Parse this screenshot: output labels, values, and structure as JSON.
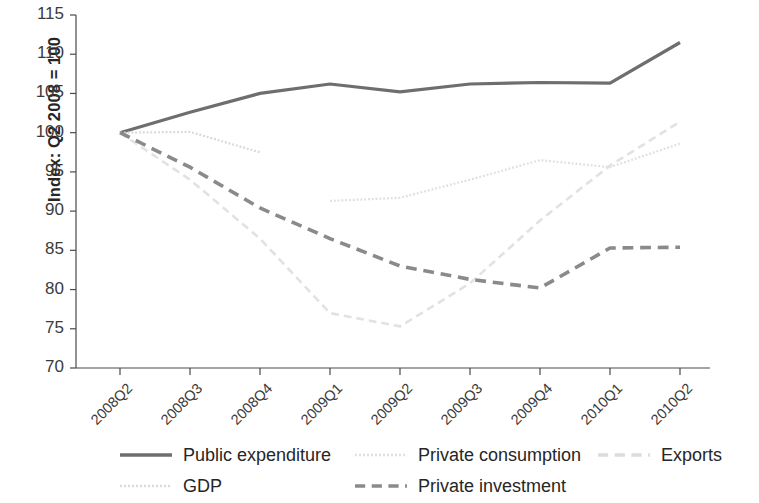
{
  "chart_data": {
    "type": "line",
    "title": "",
    "subtitle": "",
    "xlabel": "",
    "ylabel": "Index: Q2 2008 = 100",
    "categories": [
      "2008Q2",
      "2008Q3",
      "2008Q4",
      "2009Q1",
      "2009Q2",
      "2009Q3",
      "2009Q4",
      "2010Q1",
      "2010Q2"
    ],
    "ylim": [
      70,
      115
    ],
    "yticks": [
      70,
      75,
      80,
      85,
      90,
      95,
      100,
      105,
      110,
      115
    ],
    "ytick_labels": [
      "70",
      "75",
      "80",
      "85",
      "90",
      "95",
      "100",
      "105",
      "110",
      "115"
    ],
    "grid": false,
    "legend_position": "bottom",
    "series": [
      {
        "name": "Public expenditure",
        "style": "solid",
        "color": "#6e6e6e",
        "width": 3.2,
        "values": [
          100.0,
          102.6,
          105.0,
          106.2,
          105.2,
          106.2,
          106.4,
          106.3,
          111.5
        ]
      },
      {
        "name": "GDP",
        "style": "dotted",
        "color": "#d8d8d8",
        "width": 2.2,
        "values": [
          100.0,
          100.1,
          97.5,
          null,
          null,
          null,
          null,
          null,
          null
        ]
      },
      {
        "name": "Private consumption",
        "style": "dotted",
        "color": "#e0e0e0",
        "width": 2.2,
        "values": [
          null,
          null,
          null,
          91.3,
          91.7,
          94.0,
          96.5,
          95.6,
          98.6
        ]
      },
      {
        "name": "Exports",
        "style": "dashed",
        "color": "#e2e2e2",
        "width": 2.6,
        "values": [
          100.0,
          94.0,
          86.5,
          77.0,
          75.3,
          80.8,
          88.8,
          95.8,
          101.4
        ]
      },
      {
        "name": "Private investment",
        "style": "dashed",
        "color": "#8a8a8a",
        "width": 3.6,
        "values": [
          100.0,
          95.6,
          90.4,
          86.5,
          83.0,
          81.3,
          80.2,
          85.3,
          85.4
        ]
      }
    ]
  },
  "axes": {
    "y_axis_label": "Index: Q2 2008 = 100",
    "y_tick_labels": [
      "115",
      "110",
      "105",
      "100",
      "95",
      "90",
      "85",
      "80",
      "75",
      "70"
    ],
    "x_tick_labels": [
      "2008Q2",
      "2008Q3",
      "2008Q4",
      "2009Q1",
      "2009Q2",
      "2009Q3",
      "2009Q4",
      "2010Q1",
      "2010Q2"
    ]
  },
  "legend": {
    "items": [
      {
        "label": "Public expenditure",
        "style": "solid",
        "color": "#6e6e6e"
      },
      {
        "label": "Private consumption",
        "style": "dotted",
        "color": "#e0e0e0"
      },
      {
        "label": "Exports",
        "style": "dashed",
        "color": "#dcdcdc"
      },
      {
        "label": "GDP",
        "style": "dotted",
        "color": "#dadada"
      },
      {
        "label": "Private investment",
        "style": "dashed",
        "color": "#8a8a8a"
      }
    ]
  }
}
